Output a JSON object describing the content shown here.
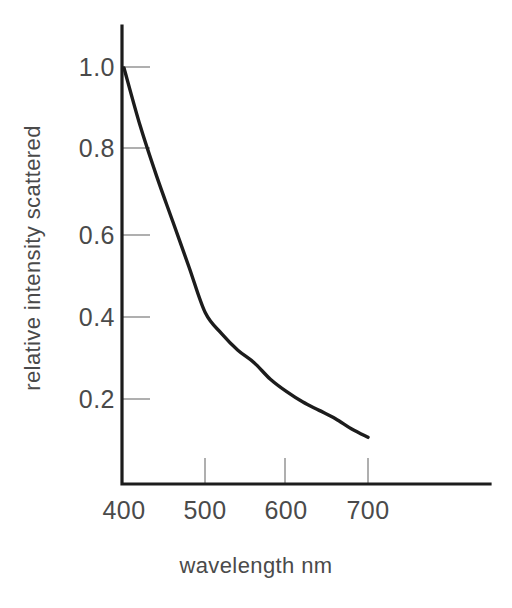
{
  "chart_data": {
    "type": "line",
    "title": "",
    "subtitle": "",
    "xlabel": "wavelength nm",
    "ylabel": "relative intensity scattered",
    "xlim": [
      400,
      790
    ],
    "ylim": [
      0.0,
      1.12
    ],
    "grid": false,
    "legend": null,
    "x_ticks": [
      400,
      500,
      600,
      700
    ],
    "x_tick_labels": [
      "400",
      "500",
      "600",
      "700"
    ],
    "y_ticks": [
      0.2,
      0.4,
      0.6,
      0.8,
      1.0
    ],
    "y_tick_labels": [
      "0.2",
      "0.4",
      "0.6",
      "0.8",
      "1.0"
    ],
    "series": [
      {
        "name": "relative intensity scattered",
        "color": "#1c1c1c",
        "x": [
          400,
          420,
          440,
          460,
          480,
          500,
          520,
          540,
          560,
          580,
          600,
          620,
          640,
          660,
          680,
          700
        ],
        "values": [
          1.0,
          0.86,
          0.74,
          0.63,
          0.52,
          0.41,
          0.36,
          0.32,
          0.29,
          0.25,
          0.22,
          0.195,
          0.175,
          0.155,
          0.13,
          0.11
        ]
      }
    ],
    "annotations": []
  },
  "axes": {
    "x_axis_label": "wavelength nm",
    "y_axis_label": "relative intensity scattered",
    "axis_color": "#1c1c1c",
    "tick_color": "#8d8d8d",
    "curve_color": "#1c1c1c",
    "background_color": "#ffffff"
  },
  "x_tick_labels": {
    "t0": "400",
    "t1": "500",
    "t2": "600",
    "t3": "700"
  },
  "y_tick_labels": {
    "t0": "0.2",
    "t1": "0.4",
    "t2": "0.6",
    "t3": "0.8",
    "t4": "1.0"
  }
}
